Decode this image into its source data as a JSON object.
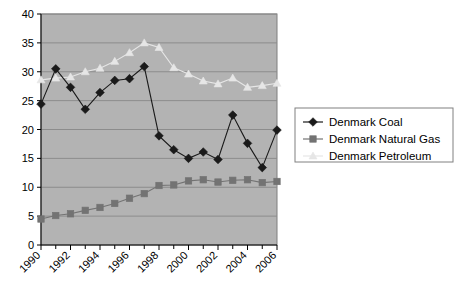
{
  "chart_data": {
    "type": "line",
    "title": "",
    "subtitle": "",
    "xlabel": "",
    "ylabel": "",
    "x": [
      1990,
      1991,
      1992,
      1993,
      1994,
      1995,
      1996,
      1997,
      1998,
      1999,
      2000,
      2001,
      2002,
      2003,
      2004,
      2005,
      2006
    ],
    "xtick_labels": [
      "1990",
      "1992",
      "1994",
      "1996",
      "1998",
      "2000",
      "2002",
      "2004",
      "2006"
    ],
    "xtick_values": [
      1990,
      1992,
      1994,
      1996,
      1998,
      2000,
      2002,
      2004,
      2006
    ],
    "ytick_labels": [
      "0",
      "5",
      "10",
      "15",
      "20",
      "25",
      "30",
      "35",
      "40"
    ],
    "ytick_values": [
      0,
      5,
      10,
      15,
      20,
      25,
      30,
      35,
      40
    ],
    "ylim": [
      0,
      40
    ],
    "xlim": [
      1990,
      2006
    ],
    "grid": "horizontal",
    "legend_position": "right",
    "plot_background": "#b3b3b3",
    "series": [
      {
        "name": "Denmark Coal",
        "color": "#1a1a1a",
        "marker": "diamond",
        "values": [
          24.4,
          30.5,
          27.3,
          23.5,
          26.4,
          28.5,
          28.8,
          30.9,
          18.9,
          16.5,
          15.0,
          16.1,
          14.8,
          22.5,
          17.6,
          13.4,
          19.9
        ]
      },
      {
        "name": "Denmark Natural Gas",
        "color": "#737373",
        "marker": "square",
        "values": [
          4.5,
          5.1,
          5.4,
          6.0,
          6.5,
          7.2,
          8.1,
          8.9,
          10.3,
          10.4,
          11.1,
          11.3,
          10.9,
          11.2,
          11.3,
          10.8,
          11.0
        ]
      },
      {
        "name": "Denmark Petroleum",
        "color": "#e6e6e6",
        "marker": "triangle",
        "values": [
          28.6,
          28.9,
          29.1,
          30.0,
          30.6,
          31.8,
          33.3,
          35.0,
          34.2,
          30.7,
          29.6,
          28.4,
          27.9,
          28.9,
          27.3,
          27.6,
          28.0
        ]
      }
    ]
  },
  "legend": {
    "items": [
      {
        "label": "Denmark Coal"
      },
      {
        "label": "Denmark Natural Gas"
      },
      {
        "label": "Denmark Petroleum"
      }
    ]
  }
}
